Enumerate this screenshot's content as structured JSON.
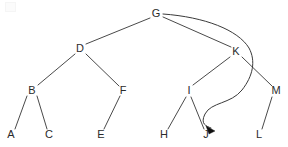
{
  "diagram": {
    "type": "tree-diagram",
    "background_color": "#ffffff",
    "edge_color": "#4a4a4a",
    "label_color": "#2b2b2b",
    "arrow_color": "#101010",
    "width": 288,
    "height": 147,
    "nodes": [
      {
        "id": "G",
        "label": "G",
        "x": 156,
        "y": 14,
        "level": 0
      },
      {
        "id": "D",
        "label": "D",
        "x": 80,
        "y": 49,
        "level": 1
      },
      {
        "id": "K",
        "label": "K",
        "x": 236,
        "y": 52,
        "level": 1
      },
      {
        "id": "B",
        "label": "B",
        "x": 32,
        "y": 91,
        "level": 2
      },
      {
        "id": "F",
        "label": "F",
        "x": 123,
        "y": 91,
        "level": 2
      },
      {
        "id": "I",
        "label": "I",
        "x": 189,
        "y": 91,
        "level": 2
      },
      {
        "id": "M",
        "label": "M",
        "x": 276,
        "y": 91,
        "level": 2
      },
      {
        "id": "A",
        "label": "A",
        "x": 11,
        "y": 135,
        "level": 3
      },
      {
        "id": "C",
        "label": "C",
        "x": 49,
        "y": 135,
        "level": 3
      },
      {
        "id": "E",
        "label": "E",
        "x": 101,
        "y": 135,
        "level": 3
      },
      {
        "id": "H",
        "label": "H",
        "x": 164,
        "y": 135,
        "level": 3
      },
      {
        "id": "J",
        "label": "J",
        "x": 206,
        "y": 135,
        "level": 3
      },
      {
        "id": "L",
        "label": "L",
        "x": 259,
        "y": 135,
        "level": 3
      }
    ],
    "edges": [
      {
        "from": "G",
        "to": "D",
        "x1": 150,
        "y1": 18,
        "x2": 86,
        "y2": 44
      },
      {
        "from": "G",
        "to": "K",
        "x1": 163,
        "y1": 17,
        "x2": 231,
        "y2": 47
      },
      {
        "from": "D",
        "to": "B",
        "x1": 75,
        "y1": 54,
        "x2": 38,
        "y2": 85
      },
      {
        "from": "D",
        "to": "F",
        "x1": 86,
        "y1": 54,
        "x2": 119,
        "y2": 86
      },
      {
        "from": "K",
        "to": "I",
        "x1": 230,
        "y1": 57,
        "x2": 193,
        "y2": 85
      },
      {
        "from": "K",
        "to": "M",
        "x1": 242,
        "y1": 57,
        "x2": 272,
        "y2": 86
      },
      {
        "from": "B",
        "to": "A",
        "x1": 27,
        "y1": 96,
        "x2": 15,
        "y2": 129
      },
      {
        "from": "B",
        "to": "C",
        "x1": 37,
        "y1": 96,
        "x2": 47,
        "y2": 129
      },
      {
        "from": "F",
        "to": "E",
        "x1": 120,
        "y1": 96,
        "x2": 104,
        "y2": 129
      },
      {
        "from": "I",
        "to": "H",
        "x1": 186,
        "y1": 97,
        "x2": 168,
        "y2": 129
      },
      {
        "from": "I",
        "to": "J",
        "x1": 191,
        "y1": 97,
        "x2": 204,
        "y2": 129
      },
      {
        "from": "M",
        "to": "L",
        "x1": 272,
        "y1": 97,
        "x2": 262,
        "y2": 129
      }
    ],
    "back_edge": {
      "from": "G",
      "to": "J",
      "description": "curved arrow from G sweeping right past K then down and left to J",
      "path": "M 163 14 C 205 17 238 30 249 48 C 256 61 253 76 242 90 C 231 104 211 102 205 114 C 200 124 206 126 211 128",
      "arrow_tip_x": 215,
      "arrow_tip_y": 131
    }
  }
}
